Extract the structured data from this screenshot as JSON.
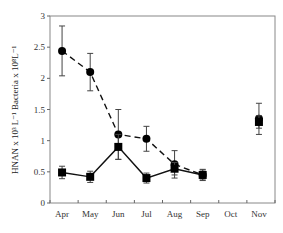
{
  "chart_data": {
    "type": "line",
    "title": "",
    "xlabel": "",
    "ylabel": "HNAN x 10^3 L^-1 Bacteria x 10^8 L^-1",
    "ylabel_display": "HNAN x 10³ L⁻¹ Bacteria x 10⁸L⁻¹",
    "ylim": [
      0,
      3
    ],
    "yticks": [
      0,
      0.5,
      1,
      1.5,
      2,
      2.5,
      3
    ],
    "ytick_labels": [
      "0",
      "0.5",
      "1",
      "1.5",
      "2",
      "2.5",
      "3"
    ],
    "categories": [
      "Apr",
      "May",
      "Jun",
      "Jul",
      "Aug",
      "Sep",
      "Oct",
      "Nov"
    ],
    "grid": false,
    "legend": null,
    "series": [
      {
        "name": "circles (dashed line)",
        "marker": "circle",
        "line_style": "dashed",
        "values": [
          2.44,
          2.1,
          1.1,
          1.03,
          0.62,
          0.45,
          null,
          1.35
        ],
        "error": [
          0.4,
          0.3,
          0.4,
          0.2,
          0.22,
          0.08,
          null,
          0.25
        ],
        "connected_to_index": 5
      },
      {
        "name": "squares (solid line)",
        "marker": "square",
        "line_style": "solid",
        "values": [
          0.49,
          0.42,
          0.9,
          0.4,
          0.55,
          0.45,
          null,
          1.3
        ],
        "error": [
          0.1,
          0.09,
          0.2,
          0.08,
          0.1,
          0.09,
          null,
          0.1
        ],
        "connected_to_index": 5
      }
    ]
  }
}
